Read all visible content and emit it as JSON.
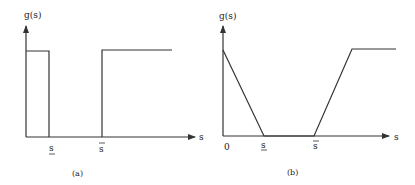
{
  "figure": {
    "panels": [
      {
        "id": "a",
        "caption": "(a)",
        "y_label": "g(s)",
        "x_label": "s",
        "tick_labels": {
          "s_lower": "s",
          "s_upper": "s"
        },
        "shape": "step function: high on [0, s_lower], zero on [s_lower, s_upper], high for s > s_upper"
      },
      {
        "id": "b",
        "caption": "(b)",
        "y_label": "g(s)",
        "x_label": "s",
        "tick_labels": {
          "origin": "0",
          "s_lower": "s",
          "s_upper": "s"
        },
        "shape": "piecewise linear: decreasing from high at 0 to zero at s_lower, zero on [s_lower, s_upper], increasing after s_upper then constant high"
      }
    ],
    "colors": {
      "line": "#333333",
      "background": "#ffffff"
    }
  }
}
